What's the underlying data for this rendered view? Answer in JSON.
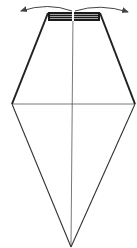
{
  "diagram": {
    "type": "origami-fold-step",
    "width": 137,
    "height": 248,
    "colors": {
      "background": "#ffffff",
      "outline": "#222222",
      "crease": "#555555",
      "pleat": "#1a1a1a",
      "arrow": "#444444"
    },
    "shape": {
      "name": "kite-outline",
      "points": [
        [
          47,
          12
        ],
        [
          100,
          12
        ],
        [
          135,
          104
        ],
        [
          71,
          247
        ],
        [
          12,
          104
        ]
      ]
    },
    "creases": [
      {
        "name": "vertical-center-crease",
        "from": [
          73,
          12
        ],
        "to": [
          71,
          247
        ]
      },
      {
        "name": "horizontal-crease",
        "from": [
          13,
          104
        ],
        "to": [
          134,
          104
        ]
      }
    ],
    "pleat_band": {
      "x": 48,
      "y": 12,
      "width": 52,
      "height": 9
    },
    "arrows": [
      {
        "name": "arrow-left",
        "direction": "left"
      },
      {
        "name": "arrow-right",
        "direction": "right"
      }
    ]
  }
}
